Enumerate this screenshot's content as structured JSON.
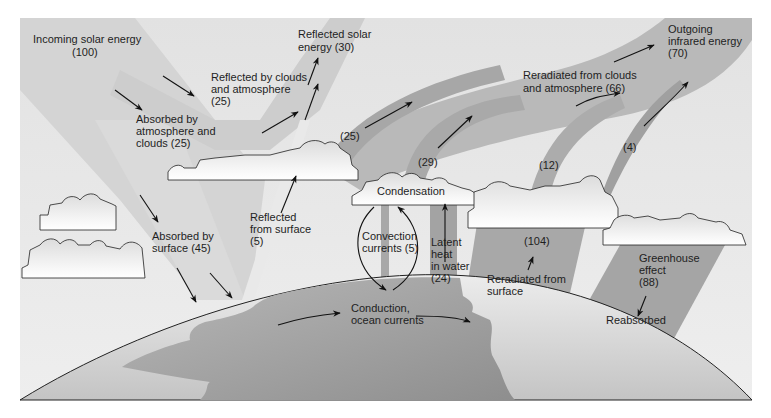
{
  "diagram": {
    "colors": {
      "page_bg": "#ffffff",
      "sky_bg": "#e4e4e4",
      "incoming_band": "#d2d2d2",
      "reflected_band": "#cccccc",
      "reradiated_band": "#a9a9a9",
      "outgoing_band": "#b9b9b9",
      "land": "#a5a5a5",
      "ocean_light": "#d8d8d8",
      "cloud_fill": "#f2f2f2",
      "arrow": "#111111"
    },
    "labels": {
      "incoming": {
        "line1": "Incoming solar energy",
        "line2": "(100)"
      },
      "reflected_solar": {
        "line1": "Reflected solar",
        "line2": "energy (30)"
      },
      "reflected_clouds": {
        "line1": "Reflected by clouds",
        "line2": "and atmosphere",
        "line3": "(25)"
      },
      "absorbed_atmos": {
        "line1": "Absorbed by",
        "line2": "atmosphere and",
        "line3": "clouds (25)"
      },
      "absorbed_surface": {
        "line1": "Absorbed by",
        "line2": "surface (45)"
      },
      "reflected_surface": {
        "line1": "Reflected",
        "line2": "from surface",
        "line3": "(5)"
      },
      "outgoing_ir": {
        "line1": "Outgoing",
        "line2": "infrared energy",
        "line3": "(70)"
      },
      "reradiated_clouds": {
        "line1": "Reradiated from clouds",
        "line2": "and atmosphere (66)"
      },
      "band_25": "(25)",
      "band_29": "(29)",
      "band_12": "(12)",
      "band_4": "(4)",
      "condensation": "Condensation",
      "convection": {
        "line1": "Convection",
        "line2": "currents (5)"
      },
      "latent_heat": {
        "line1": "Latent",
        "line2": "heat",
        "line3": "in water",
        "line4": "(24)"
      },
      "surface_104": "(104)",
      "reradiated_surface": {
        "line1": "Reradiated from",
        "line2": "surface"
      },
      "greenhouse": {
        "line1": "Greenhouse",
        "line2": "effect",
        "line3": "(88)"
      },
      "reabsorbed": "Reabsorbed",
      "conduction": {
        "line1": "Conduction,",
        "line2": "ocean currents"
      }
    }
  }
}
